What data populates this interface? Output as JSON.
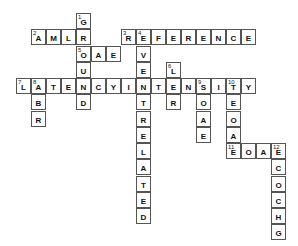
{
  "puzzle": {
    "type": "crossword",
    "grid": {
      "origin_x": 16,
      "origin_y": 13,
      "cell_w": 15,
      "row_h": 16.25,
      "border_color": "#555555"
    },
    "words": [
      {
        "num": "1",
        "dir": "down",
        "row": 0,
        "col": 4,
        "answer": "GROUND"
      },
      {
        "num": "2",
        "dir": "across",
        "row": 1,
        "col": 1,
        "answer": "AMLR"
      },
      {
        "num": "3",
        "dir": "across",
        "row": 1,
        "col": 7,
        "answer": "REFERENCE"
      },
      {
        "num": "4",
        "dir": "down",
        "row": 1,
        "col": 8,
        "answer": "EVENTRELATED"
      },
      {
        "num": "5",
        "dir": "across",
        "row": 2,
        "col": 4,
        "answer": "OAE"
      },
      {
        "num": "6",
        "dir": "down",
        "row": 3,
        "col": 10,
        "answer": "LER"
      },
      {
        "num": "7",
        "dir": "across",
        "row": 4,
        "col": 0,
        "answer": "LATENCYINTENSITY"
      },
      {
        "num": "8",
        "dir": "down",
        "row": 4,
        "col": 1,
        "answer": "ABR"
      },
      {
        "num": "9",
        "dir": "down",
        "row": 4,
        "col": 12,
        "answer": "SOAE"
      },
      {
        "num": "10",
        "dir": "down",
        "row": 4,
        "col": 14,
        "answer": "TEOAE"
      },
      {
        "num": "11",
        "dir": "across",
        "row": 8,
        "col": 14,
        "answer": "EOAE"
      },
      {
        "num": "12",
        "dir": "down",
        "row": 8,
        "col": 17,
        "answer": "ECOCHG"
      }
    ]
  }
}
